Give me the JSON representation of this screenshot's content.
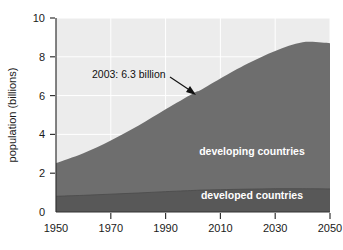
{
  "chart_data": {
    "type": "area",
    "stacked": true,
    "title": "",
    "subtitle": "",
    "xlabel": "",
    "ylabel": "population (billions)",
    "xlim": [
      1950,
      2050
    ],
    "ylim": [
      0,
      10
    ],
    "grid": true,
    "legend_position": "inline-labels",
    "x_tick_labels": [
      "1950",
      "1970",
      "1990",
      "2010",
      "2030",
      "2050"
    ],
    "x_ticks": [
      1950,
      1970,
      1990,
      2010,
      2030,
      2050
    ],
    "y_tick_labels": [
      "0",
      "2",
      "4",
      "6",
      "8",
      "10"
    ],
    "y_ticks": [
      0,
      2,
      4,
      6,
      8,
      10
    ],
    "x": [
      1950,
      1960,
      1970,
      1980,
      1990,
      2000,
      2003,
      2010,
      2020,
      2030,
      2040,
      2050
    ],
    "series": [
      {
        "name": "developed countries",
        "label": "developed countries",
        "color": "#585858",
        "values": [
          0.81,
          0.86,
          0.92,
          0.98,
          1.05,
          1.11,
          1.13,
          1.15,
          1.18,
          1.2,
          1.2,
          1.19
        ]
      },
      {
        "name": "developing countries",
        "label": "developing countries",
        "color": "#6e6e6e",
        "values": [
          1.71,
          2.17,
          2.77,
          3.46,
          4.24,
          5.0,
          5.17,
          5.73,
          6.47,
          7.1,
          7.55,
          7.51
        ]
      }
    ],
    "totals": [
      2.52,
      3.03,
      3.69,
      4.44,
      5.29,
      6.11,
      6.3,
      6.88,
      7.65,
      8.3,
      8.75,
      8.7
    ],
    "annotations": [
      {
        "text": "2003: 6.3 billion",
        "x": 2003,
        "y": 6.3,
        "arrow": true
      }
    ],
    "plot_background": "#ececec",
    "grid_color": "#ffffff",
    "axis_color": "#333333"
  },
  "axes": {
    "y_title": "population (billions)"
  },
  "labels": {
    "developing": "developing countries",
    "developed": "developed countries",
    "annotation": "2003: 6.3 billion"
  }
}
